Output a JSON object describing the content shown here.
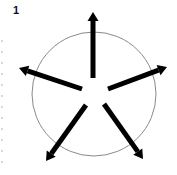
{
  "figure": {
    "panel_label": "1",
    "colors": {
      "circle_stroke": "#8a8a8a",
      "arrow_fill": "#000000",
      "background": "#ffffff"
    },
    "circle": {
      "cx": 94,
      "cy": 94,
      "r": 62
    },
    "arrows": [
      {
        "name": "arrow-up",
        "x1": 93,
        "y1": 78,
        "x2": 93,
        "y2": 12
      },
      {
        "name": "arrow-upper-right",
        "x1": 108,
        "y1": 89,
        "x2": 167,
        "y2": 67
      },
      {
        "name": "arrow-upper-left",
        "x1": 82,
        "y1": 89,
        "x2": 19,
        "y2": 68
      },
      {
        "name": "arrow-lower-left",
        "x1": 86,
        "y1": 105,
        "x2": 46,
        "y2": 161
      },
      {
        "name": "arrow-lower-right",
        "x1": 104,
        "y1": 104,
        "x2": 143,
        "y2": 159
      }
    ]
  }
}
